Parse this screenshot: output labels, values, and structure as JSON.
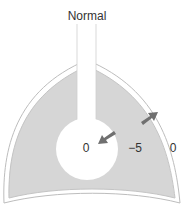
{
  "diagram": {
    "title": "Normal",
    "labels": {
      "airway_pressure": "0",
      "pleural_pressure": "−5",
      "atmospheric_pressure": "0"
    },
    "arrows": [
      {
        "name": "lung-recoil-arrow",
        "direction": "inward"
      },
      {
        "name": "chest-wall-recoil-arrow",
        "direction": "outward"
      }
    ],
    "colors": {
      "pleural_fill": "#d6d6d6",
      "outline": "#bdbdbd",
      "arrow": "#707070",
      "text": "#333333"
    }
  }
}
